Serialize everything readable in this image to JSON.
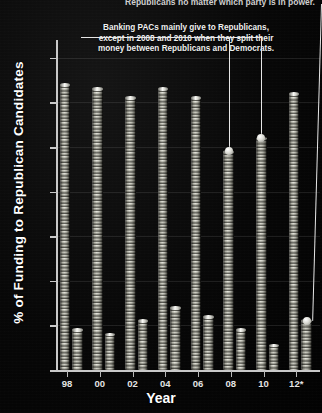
{
  "top_caption": "Republicans no matter which party is in power.",
  "annotation": {
    "line1": "Banking PACs mainly give to Republicans,",
    "line2": "except in 2008 and 2010 when they split their",
    "line3": "money between Republicans and Democrats."
  },
  "axis": {
    "ylabel": "% of Funding to Republican Candidates",
    "xlabel": "Year"
  },
  "colors": {
    "background": "#050505",
    "axis": "#c9c9c9",
    "text": "#ffffff",
    "gridline": "#bebebe",
    "coin": "#f5f5f0",
    "leader": "#e6e6e6"
  },
  "chart_data": {
    "type": "bar",
    "title": "",
    "subtitle": "",
    "xlabel": "Year",
    "ylabel": "% of Funding to Republican Candidates",
    "ylim": [
      0,
      74
    ],
    "yticks": [
      0,
      10,
      20,
      30,
      40,
      50,
      60,
      70
    ],
    "grid": true,
    "legend": "none",
    "categories": [
      "98",
      "00",
      "02",
      "04",
      "06",
      "08",
      "10",
      "12*"
    ],
    "series": [
      {
        "name": "Republican share",
        "values": [
          64,
          63,
          61,
          63,
          61,
          49,
          52,
          62
        ]
      },
      {
        "name": "Secondary bar",
        "values": [
          9,
          8,
          11,
          14,
          12,
          9,
          5.5,
          11
        ]
      }
    ],
    "annotations": [
      {
        "text": "Banking PACs mainly give to Republicans, except in 2008 and 2010 when they split their money between Republicans and Democrats.",
        "points_to": [
          "08",
          "10"
        ]
      },
      {
        "text": "Republicans no matter which party is in power.",
        "points_to": [
          "12*"
        ]
      }
    ]
  }
}
